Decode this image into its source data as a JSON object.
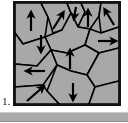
{
  "figure": {
    "label": "1.",
    "caption_number": "1",
    "panel": {
      "border_color": "#121212",
      "border_width_px": 2,
      "fill_color": "#a8a8a8",
      "grain_boundary_color": "#000000",
      "arrow_color": "#000000",
      "x": 13,
      "y": 1,
      "width": 108,
      "height": 105
    },
    "background_color": "#ffffff",
    "bottom_bar": {
      "color": "#a9a9a9",
      "highlight_color": "#cdcdcd",
      "shadow_color": "#8f8f8f",
      "x": 0,
      "y": 112,
      "width": 128,
      "height": 10
    }
  },
  "chart_data": {
    "type": "diagram",
    "xlabel": "",
    "ylabel": "",
    "viewbox": [
      0,
      0,
      104,
      101
    ],
    "grain_fill": "#a8a8a8",
    "boundary_color": "#000000",
    "boundary_width": 1.6,
    "grains": [
      {
        "id": "g1",
        "polygon": "0,0 26,0 33,14 30,34 8,41 0,30"
      },
      {
        "id": "g2",
        "polygon": "26,0 52,0 56,10 47,27 38,30 33,14"
      },
      {
        "id": "g3",
        "polygon": "52,0 66,0 70,9 63,24 56,10"
      },
      {
        "id": "g4",
        "polygon": "66,0 86,0 84,13 75,26 63,24 70,9"
      },
      {
        "id": "g5",
        "polygon": "86,0 104,0 104,24 86,30 84,13"
      },
      {
        "id": "g6",
        "polygon": "30,34 47,27 56,10 63,24 75,26 70,42 52,50 36,47"
      },
      {
        "id": "g7",
        "polygon": "0,30 8,41 30,34 36,47 22,63 0,61"
      },
      {
        "id": "g8",
        "polygon": "104,24 86,30 75,26 70,42 84,50 104,45"
      },
      {
        "id": "g9",
        "polygon": "36,47 52,50 70,42 84,50 72,72 56,68 42,62"
      },
      {
        "id": "g10",
        "polygon": "104,45 84,50 72,72 80,84 104,78"
      },
      {
        "id": "g11",
        "polygon": "0,61 22,63 36,47 42,62 28,82 0,84"
      },
      {
        "id": "g12",
        "polygon": "42,62 56,68 72,72 80,84 74,101 44,101 32,88"
      },
      {
        "id": "g13",
        "polygon": "0,84 28,82 32,88 44,101 0,101"
      },
      {
        "id": "g14",
        "polygon": "80,84 104,78 104,101 74,101"
      }
    ],
    "arrows": [
      {
        "id": "a1",
        "grain": "g1",
        "x1": 16,
        "y1": 28,
        "x2": 16,
        "y2": 10,
        "direction": "up"
      },
      {
        "id": "a2",
        "grain": "g2",
        "x1": 38,
        "y1": 26,
        "x2": 48,
        "y2": 10,
        "direction": "up-right"
      },
      {
        "id": "a3",
        "grain": "g3",
        "x1": 61,
        "y1": 4,
        "x2": 59,
        "y2": 15,
        "direction": "down"
      },
      {
        "id": "a4",
        "grain": "g4",
        "x1": 73,
        "y1": 24,
        "x2": 73,
        "y2": 8,
        "direction": "up"
      },
      {
        "id": "a5",
        "grain": "g5",
        "x1": 99,
        "y1": 22,
        "x2": 90,
        "y2": 7,
        "direction": "up-left"
      },
      {
        "id": "a6",
        "grain": "g7",
        "x1": 26,
        "y1": 32,
        "x2": 26,
        "y2": 48,
        "direction": "down"
      },
      {
        "id": "a7",
        "grain": "g8",
        "x1": 83,
        "y1": 38,
        "x2": 100,
        "y2": 38,
        "direction": "right"
      },
      {
        "id": "a8",
        "grain": "g9",
        "x1": 55,
        "y1": 66,
        "x2": 55,
        "y2": 48,
        "direction": "up"
      },
      {
        "id": "a9",
        "grain": "g11",
        "x1": 30,
        "y1": 68,
        "x2": 12,
        "y2": 68,
        "direction": "left"
      },
      {
        "id": "a10",
        "grain": "g13",
        "x1": 12,
        "y1": 98,
        "x2": 28,
        "y2": 84,
        "direction": "up-right"
      },
      {
        "id": "a11",
        "grain": "g12",
        "x1": 58,
        "y1": 80,
        "x2": 58,
        "y2": 96,
        "direction": "down"
      }
    ],
    "legend": [],
    "grid": false
  }
}
